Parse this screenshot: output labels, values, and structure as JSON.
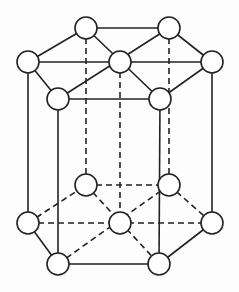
{
  "diagram": {
    "title": "",
    "atom_radius": 11,
    "colors": {
      "line": "#222222",
      "atom_fill": "#ffffff",
      "background": "#fdfdfd"
    },
    "top_face": {
      "back_left": [
        86,
        28
      ],
      "back_right": [
        169,
        28
      ],
      "left": [
        28,
        62
      ],
      "center": [
        120,
        62
      ],
      "right": [
        212,
        62
      ],
      "front_left": [
        58,
        99
      ],
      "front_right": [
        160,
        99
      ]
    },
    "bottom_face": {
      "back_left": [
        86,
        185
      ],
      "back_right": [
        169,
        185
      ],
      "left": [
        28,
        223
      ],
      "center": [
        120,
        223
      ],
      "right": [
        212,
        223
      ],
      "front_left": [
        58,
        264
      ],
      "front_right": [
        159,
        264
      ]
    }
  }
}
